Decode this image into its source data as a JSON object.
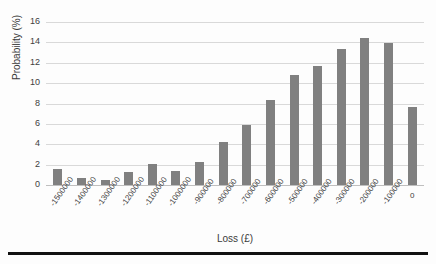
{
  "chart_data": {
    "type": "bar",
    "title": "",
    "xlabel": "Loss (£)",
    "ylabel": "Probability (%)",
    "ylim": [
      0,
      16
    ],
    "yticks": [
      0,
      2,
      4,
      6,
      8,
      10,
      12,
      14,
      16
    ],
    "grid": true,
    "legend": false,
    "bar_color": "#808080",
    "gridline_color": "#d9d9d9",
    "categories": [
      "-1500000",
      "-1400000",
      "-1300000",
      "-1200000",
      "-1100000",
      "-1000000",
      "-900000",
      "-800000",
      "-700000",
      "-600000",
      "-500000",
      "-400000",
      "-300000",
      "-200000",
      "-100000",
      "0"
    ],
    "values": [
      1.6,
      0.7,
      0.45,
      1.25,
      2.1,
      1.4,
      2.3,
      4.25,
      5.9,
      8.3,
      10.8,
      11.7,
      13.4,
      14.45,
      13.9,
      7.65
    ]
  }
}
